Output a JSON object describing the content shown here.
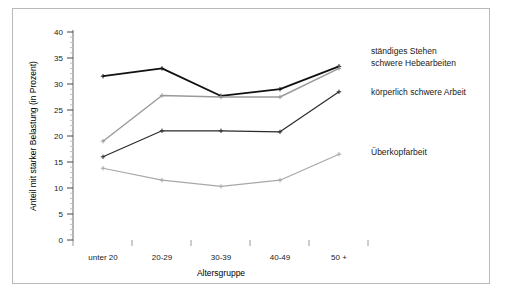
{
  "chart_data": {
    "type": "line",
    "title": "",
    "xlabel": "Altersgruppe",
    "ylabel": "Anteil mit starker Belastung (in Prozent)",
    "categories": [
      "unter 20",
      "20-29",
      "30-39",
      "40-49",
      "50 +"
    ],
    "ylim": [
      0,
      40
    ],
    "yticks": [
      0,
      5,
      10,
      15,
      20,
      25,
      30,
      35,
      40
    ],
    "ytick_labels": [
      "0",
      "5",
      "10",
      "15",
      "20",
      "25",
      "30",
      "35",
      "40"
    ],
    "grid": false,
    "minor_ticks": true,
    "legend_position": "right-inline",
    "series": [
      {
        "name": "ständiges Stehen",
        "color": "#111111",
        "width": 1.8,
        "values": [
          31.5,
          33.0,
          27.7,
          29.0,
          33.4
        ]
      },
      {
        "name": "schwere Hebearbeiten",
        "color": "#9a9a9a",
        "width": 1.4,
        "values": [
          19.0,
          27.8,
          27.5,
          27.5,
          33.0
        ]
      },
      {
        "name": "körperlich schwere Arbeit",
        "color": "#2b2b2b",
        "width": 1.2,
        "values": [
          16.0,
          21.0,
          21.0,
          20.8,
          28.5
        ]
      },
      {
        "name": "Überkopfarbeit",
        "color": "#a8a8a8",
        "width": 1.2,
        "values": [
          13.8,
          11.5,
          10.3,
          11.5,
          16.5
        ]
      }
    ]
  },
  "labels": {
    "legend": [
      "ständiges Stehen",
      "schwere Hebearbeiten",
      "körperlich schwere Arbeit",
      "Überkopfarbeit"
    ]
  },
  "colors": {
    "frame_border": "#b9b9b9",
    "axis": "#555555",
    "background": "#ffffff",
    "text": "#1a1a1a"
  }
}
